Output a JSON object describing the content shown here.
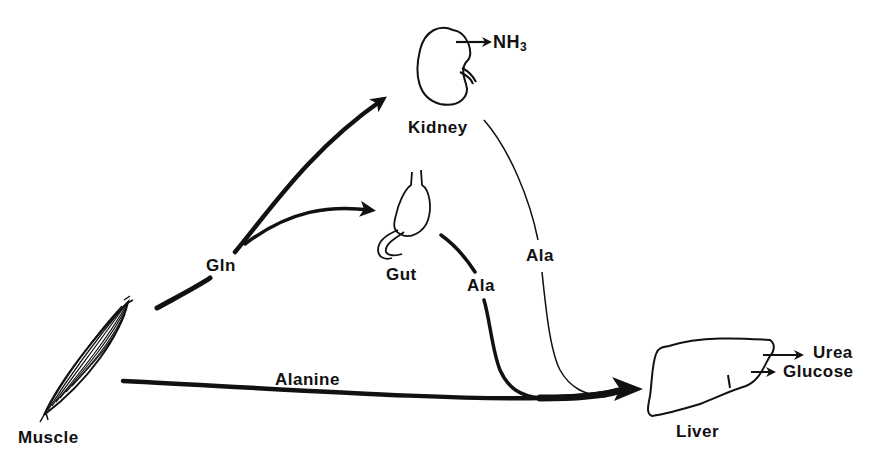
{
  "diagram": {
    "type": "metabolic-flow",
    "colors": {
      "ink": "#111111",
      "background": "#ffffff"
    },
    "organs": {
      "muscle": {
        "label": "Muscle"
      },
      "kidney": {
        "label": "Kidney",
        "output": "NH",
        "output_sub": "3"
      },
      "gut": {
        "label": "Gut"
      },
      "liver": {
        "label": "Liver",
        "outputs": [
          "Urea",
          "Glucose"
        ]
      }
    },
    "flows": {
      "gln": {
        "label": "Gln",
        "from": "Muscle",
        "to": [
          "Kidney",
          "Gut"
        ]
      },
      "alanine": {
        "label": "Alanine",
        "from": "Muscle",
        "to": "Liver"
      },
      "gut_ala": {
        "label": "Ala",
        "from": "Gut",
        "to": "Liver"
      },
      "kidney_ala": {
        "label": "Ala",
        "from": "Kidney",
        "to": "Liver"
      }
    }
  }
}
